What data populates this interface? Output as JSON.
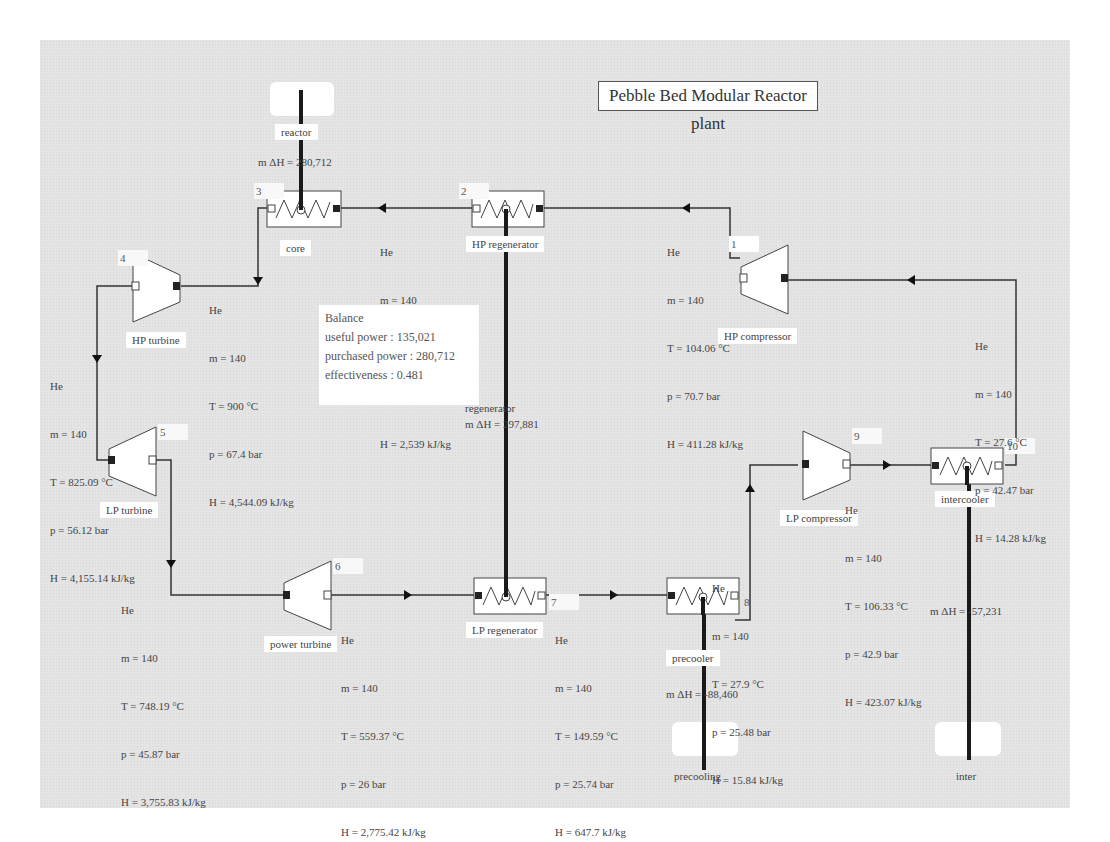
{
  "title": "Pebble Bed Modular Reactor plant",
  "fluid": "He",
  "components": [
    {
      "id": "3",
      "name": "core",
      "type": "heat-exchanger"
    },
    {
      "id": "2",
      "name": "HP regenerator",
      "type": "heat-exchanger"
    },
    {
      "id": "4",
      "name": "HP turbine",
      "type": "turbine"
    },
    {
      "id": "5",
      "name": "LP turbine",
      "type": "turbine"
    },
    {
      "id": "6",
      "name": "power turbine",
      "type": "turbine"
    },
    {
      "id": "7",
      "name": "LP regenerator",
      "type": "heat-exchanger"
    },
    {
      "id": "8",
      "name": "precooler",
      "type": "heat-exchanger"
    },
    {
      "id": "9",
      "name": "LP compressor",
      "type": "compressor"
    },
    {
      "id": "10",
      "name": "intercooler",
      "type": "heat-exchanger"
    },
    {
      "id": "1",
      "name": "HP compressor",
      "type": "compressor"
    }
  ],
  "external_sources": [
    {
      "name": "reactor",
      "duty_label": "m ΔH = 280,712"
    },
    {
      "name": "regenerator",
      "duty_label": "m ΔH = 297,881"
    },
    {
      "name": "precooling",
      "duty_label": "m ΔH = -88,460"
    },
    {
      "name": "inter",
      "duty_label": "m ΔH = -57,231"
    }
  ],
  "streams": [
    {
      "location": "HP regenerator to core",
      "fluid": "He",
      "m": "m = 140",
      "T": "T = 513.84 °C",
      "p": "p = 70 bar",
      "H": "H = 2,539 kJ/kg"
    },
    {
      "location": "core to HP turbine",
      "fluid": "He",
      "m": "m = 140",
      "T": "T = 900 °C",
      "p": "p = 67.4 bar",
      "H": "H = 4,544.09 kJ/kg"
    },
    {
      "location": "HP turbine to LP turbine",
      "fluid": "He",
      "m": "m = 140",
      "T": "T = 825.09 °C",
      "p": "p = 56.12 bar",
      "H": "H = 4,155.14 kJ/kg"
    },
    {
      "location": "LP turbine to power turbine",
      "fluid": "He",
      "m": "m = 140",
      "T": "T = 748.19 °C",
      "p": "p = 45.87 bar",
      "H": "H = 3,755.83 kJ/kg"
    },
    {
      "location": "power turbine to LP regenerator",
      "fluid": "He",
      "m": "m = 140",
      "T": "T = 559.37 °C",
      "p": "p = 26 bar",
      "H": "H = 2,775.42 kJ/kg"
    },
    {
      "location": "LP regenerator to precooler",
      "fluid": "He",
      "m": "m = 140",
      "T": "T = 149.59 °C",
      "p": "p = 25.74 bar",
      "H": "H = 647.7 kJ/kg"
    },
    {
      "location": "precooler to LP compressor",
      "fluid": "He",
      "m": "m = 140",
      "T": "T = 27.9 °C",
      "p": "p = 25.48 bar",
      "H": "H = 15.84 kJ/kg"
    },
    {
      "location": "LP compressor to intercooler",
      "fluid": "He",
      "m": "m = 140",
      "T": "T = 106.33 °C",
      "p": "p = 42.9 bar",
      "H": "H = 423.07 kJ/kg"
    },
    {
      "location": "intercooler to HP compressor",
      "fluid": "He",
      "m": "m = 140",
      "T": "T = 27.6 °C",
      "p": "p = 42.47 bar",
      "H": "H = 14.28 kJ/kg"
    },
    {
      "location": "HP compressor to HP regenerator",
      "fluid": "He",
      "m": "m = 140",
      "T": "T = 104.06 °C",
      "p": "p = 70.7 bar",
      "H": "H = 411.28 kJ/kg"
    }
  ],
  "balance": {
    "heading": "Balance",
    "useful_power": "useful power : 135,021",
    "purchased_power": "purchased power : 280,712",
    "effectiveness": "effectiveness : 0.481"
  }
}
